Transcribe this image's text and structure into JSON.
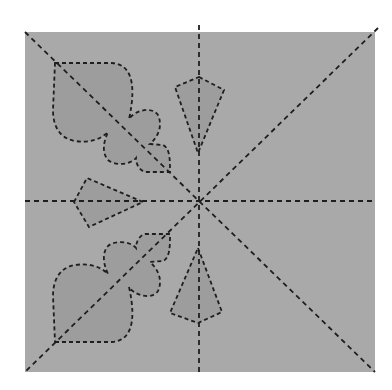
{
  "diagram": {
    "type": "paper-cutting-pattern",
    "colors": {
      "background": "#ffffff",
      "paper": "#a9a9a9",
      "cutout_fill": "#9d9d9d",
      "line": "#1e1e1e"
    },
    "square": {
      "x": 25,
      "y": 32,
      "width": 350,
      "height": 340
    },
    "center": {
      "x": 199,
      "y": 201
    },
    "fold_lines": [
      {
        "name": "vertical",
        "x1": 199,
        "y1": 25,
        "x2": 199,
        "y2": 372
      },
      {
        "name": "horizontal",
        "x1": 25,
        "y1": 201,
        "x2": 375,
        "y2": 201
      },
      {
        "name": "diagonal-tl-br",
        "x1": 25,
        "y1": 32,
        "x2": 375,
        "y2": 372
      },
      {
        "name": "diagonal-tr-bl",
        "x1": 378,
        "y1": 28,
        "x2": 25,
        "y2": 372
      }
    ],
    "cutouts": [
      {
        "name": "kite-top",
        "points": "199,77 224,90 198,153 175,87"
      },
      {
        "name": "kite-left",
        "points": "74,202 87,178 143,202 89,227"
      },
      {
        "name": "kite-bottom",
        "points": "198,248 222,312 198,323 170,313"
      },
      {
        "name": "spade-club-top-left"
      },
      {
        "name": "spade-club-bottom-left"
      }
    ]
  }
}
